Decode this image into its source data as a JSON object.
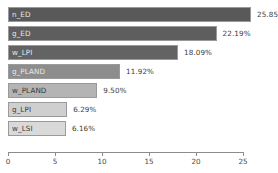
{
  "chart_data": {
    "type": "bar",
    "orientation": "horizontal",
    "title": "",
    "xlabel": "",
    "ylabel": "",
    "categories": [
      "n_ED",
      "g_ED",
      "w_LPI",
      "g_PLAND",
      "w_PLAND",
      "g_LPI",
      "w_LSI"
    ],
    "values": [
      25.85,
      22.19,
      18.09,
      11.92,
      9.5,
      6.29,
      6.16
    ],
    "value_labels": [
      "25.85%",
      "22.19%",
      "18.09%",
      "11.92%",
      "9.50%",
      "6.29%",
      "6.16%"
    ],
    "xlim": [
      0,
      25
    ],
    "xticks": [
      0,
      5,
      10,
      15,
      20,
      25
    ],
    "xtick_labels": [
      "0",
      "5",
      "10",
      "15",
      "20",
      "25"
    ],
    "grid": false,
    "legend": "none",
    "bar_colors": [
      "#595959",
      "#5e5e5e",
      "#636363",
      "#8d8d8d",
      "#b4b4b4",
      "#cfcfcf",
      "#d9d9d9"
    ],
    "label_text_colors": [
      "on-dark",
      "on-dark",
      "on-dark",
      "on-dark",
      "on-light",
      "on-light",
      "on-light"
    ]
  }
}
